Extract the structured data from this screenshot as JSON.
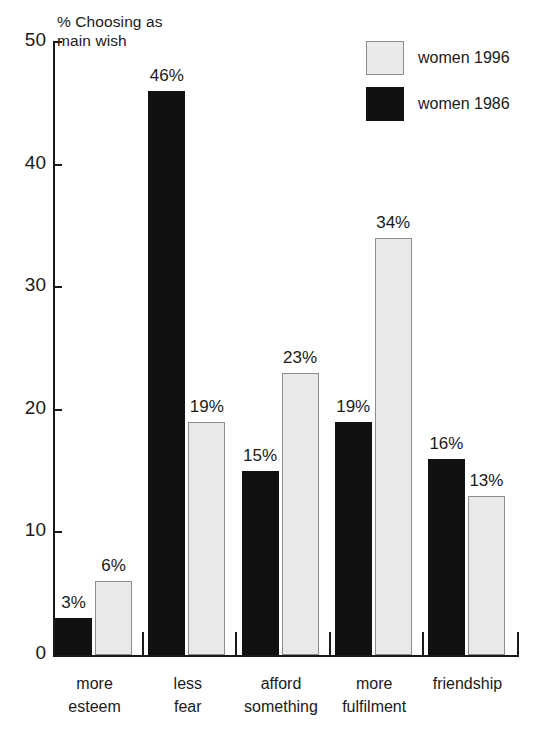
{
  "chart_data": {
    "type": "bar",
    "title": "",
    "ylabel": "% Choosing as\nmain wish",
    "xlabel": "",
    "ylim": [
      0,
      50
    ],
    "yticks": [
      0,
      10,
      20,
      30,
      40,
      50
    ],
    "ytick_labels": [
      "0",
      "10",
      "20",
      "30",
      "40",
      "50"
    ],
    "grid": false,
    "legend_position": "top-right",
    "categories": [
      "more\nesteem",
      "less\nfear",
      "afford\nsomething",
      "more\nfulfilment",
      "friendship"
    ],
    "series": [
      {
        "name": "women 1986",
        "color": "#111111",
        "values": [
          3,
          46,
          15,
          19,
          16
        ],
        "value_labels": [
          "3%",
          "46%",
          "15%",
          "19%",
          "16%"
        ]
      },
      {
        "name": "women 1996",
        "color": "#e9e9e9",
        "values": [
          6,
          19,
          23,
          34,
          13
        ],
        "value_labels": [
          "6%",
          "19%",
          "23%",
          "34%",
          "13%"
        ]
      }
    ]
  },
  "legend": {
    "items": [
      {
        "label": "women 1996",
        "swatch": "light"
      },
      {
        "label": "women 1986",
        "swatch": "dark"
      }
    ]
  },
  "axes": {
    "y_title_line1": "% Choosing as",
    "y_title_line2": "main wish"
  }
}
